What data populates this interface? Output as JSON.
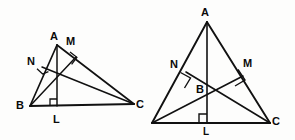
{
  "figure": {
    "type": "geometry-diagram",
    "background_color": "#fdfdfc",
    "stroke_color": "#111111",
    "label_color": "#0a0a0a",
    "width": 295,
    "height": 140,
    "diagrams": [
      {
        "id": "left-triangle",
        "name": "acute-triangle-with-altitudes",
        "vertices": [
          {
            "name": "A",
            "label": "A",
            "x": 57,
            "y": 45,
            "label_x": 50,
            "label_y": 31
          },
          {
            "name": "B",
            "label": "B",
            "x": 30,
            "y": 106,
            "label_x": 16,
            "label_y": 100
          },
          {
            "name": "C",
            "label": "C",
            "x": 134,
            "y": 104,
            "label_x": 136,
            "label_y": 99
          }
        ],
        "feet": [
          {
            "name": "L",
            "label": "L",
            "x": 57,
            "y": 106,
            "label_x": 53,
            "label_y": 117
          },
          {
            "name": "M",
            "label": "M",
            "x": 76,
            "y": 57,
            "label_x": 66,
            "label_y": 36
          },
          {
            "name": "N",
            "label": "N",
            "x": 42,
            "y": 67,
            "label_x": 27,
            "label_y": 56
          }
        ],
        "orthocenter": {
          "name": "H",
          "x": 57,
          "y": 73
        },
        "sides": [
          {
            "from": "A",
            "to": "B"
          },
          {
            "from": "B",
            "to": "C"
          },
          {
            "from": "C",
            "to": "A"
          }
        ],
        "altitudes": [
          {
            "from": "A",
            "to": "L"
          },
          {
            "from": "B",
            "to": "M"
          },
          {
            "from": "C",
            "to": "N"
          }
        ],
        "right_angle_marks": [
          {
            "at": "L",
            "size": 7
          },
          {
            "at": "M",
            "size": 7
          },
          {
            "at": "N",
            "size": 7
          }
        ]
      },
      {
        "id": "right-triangle",
        "name": "isosceles-triangle-with-altitudes",
        "vertices": [
          {
            "name": "A",
            "label": "A",
            "x": 207,
            "y": 22,
            "label_x": 201,
            "label_y": 7
          },
          {
            "name": "B2",
            "label": "",
            "x": 152,
            "y": 123,
            "label_x": 0,
            "label_y": 0
          },
          {
            "name": "C",
            "label": "C",
            "x": 270,
            "y": 123,
            "label_x": 272,
            "label_y": 117
          }
        ],
        "feet": [
          {
            "name": "L",
            "label": "L",
            "x": 207,
            "y": 123,
            "label_x": 203,
            "label_y": 128
          },
          {
            "name": "M",
            "label": "M",
            "x": 243,
            "y": 76,
            "label_x": 243,
            "label_y": 58
          },
          {
            "name": "N",
            "label": "N",
            "x": 186,
            "y": 72,
            "label_x": 170,
            "label_y": 59
          }
        ],
        "orthocenter": {
          "name": "B",
          "label": "B",
          "x": 208,
          "y": 92,
          "label_x": 196,
          "label_y": 84
        },
        "sides": [
          {
            "from": "A",
            "to": "B2"
          },
          {
            "from": "B2",
            "to": "C"
          },
          {
            "from": "C",
            "to": "A"
          }
        ],
        "altitudes": [
          {
            "from": "A",
            "to": "L"
          },
          {
            "from": "B2",
            "to": "M"
          },
          {
            "from": "C",
            "to": "N"
          }
        ],
        "right_angle_marks": [
          {
            "at": "L",
            "size": 8
          },
          {
            "at": "M",
            "size": 8
          },
          {
            "at": "N",
            "size": 8
          }
        ]
      }
    ],
    "labels": {
      "left_A": "A",
      "left_B": "B",
      "left_C": "C",
      "left_L": "L",
      "left_M": "M",
      "left_N": "N",
      "right_A": "A",
      "right_B": "B",
      "right_C": "C",
      "right_L": "L",
      "right_M": "M",
      "right_N": "N"
    }
  }
}
